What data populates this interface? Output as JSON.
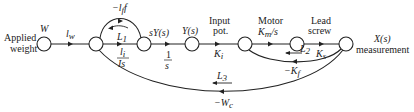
{
  "diagram": {
    "type": "signal-flow-graph",
    "nodes": [
      {
        "id": "W",
        "label": "W",
        "caption": [
          "Applied",
          "weight"
        ]
      },
      {
        "id": "n2",
        "label": ""
      },
      {
        "id": "sY",
        "label": "sY(s)"
      },
      {
        "id": "Y",
        "label": "Y(s)"
      },
      {
        "id": "n5",
        "label": "",
        "caption": [
          "Input",
          "pot."
        ]
      },
      {
        "id": "n6",
        "label": "",
        "caption": [
          "Motor",
          "Km/s"
        ]
      },
      {
        "id": "X",
        "label": "X(s)",
        "caption": [
          "measurement"
        ]
      }
    ],
    "branches": [
      {
        "from": "W",
        "to": "n2",
        "gain": "l_w"
      },
      {
        "from": "n2",
        "to": "sY",
        "gain_num": "1",
        "gain_den": "Is"
      },
      {
        "from": "sY",
        "to": "n2",
        "gain": "−l_f f"
      },
      {
        "from": "sY",
        "to": "Y",
        "gain_num": "1",
        "gain_den": "s"
      },
      {
        "from": "Y",
        "to": "n5",
        "gain": "K_i"
      },
      {
        "from": "n5",
        "to": "n6",
        "gain": "Km/s"
      },
      {
        "from": "n6",
        "to": "X",
        "gain": "K_s"
      },
      {
        "from": "X",
        "to": "n5",
        "gain": "−K_f"
      },
      {
        "from": "X",
        "to": "n2",
        "gain": "−W_c"
      }
    ],
    "loops": [
      "L1",
      "L2",
      "L3"
    ]
  },
  "labels": {
    "applied": "Applied",
    "weight": "weight",
    "W": "W",
    "lw_l": "l",
    "lw_sub": "w",
    "lf_minus": "−l",
    "lf_sub": "f",
    "lf_f": "f",
    "L1": "L",
    "L1_sub": "1",
    "frac1_num": "l",
    "frac1_num_sub": "i",
    "frac1_den": "Is",
    "sY": "sY(s)",
    "one_s_num": "1",
    "one_s_den": "s",
    "Ys": "Y(s)",
    "input": "Input",
    "pot": "pot.",
    "Ki": "K",
    "Ki_sub": "i",
    "motor": "Motor",
    "Km": "K",
    "Km_sub": "m",
    "Km_s": "/s",
    "lead": "Lead",
    "screw": "screw",
    "Ks": "K",
    "Ks_sub": "s",
    "L2": "L",
    "L2_sub": "2",
    "Kf": "−K",
    "Kf_sub": "f",
    "Xs": "X(s)",
    "measurement": "measurement",
    "L3": "L",
    "L3_sub": "3",
    "Wc": "−W",
    "Wc_sub": "c"
  }
}
